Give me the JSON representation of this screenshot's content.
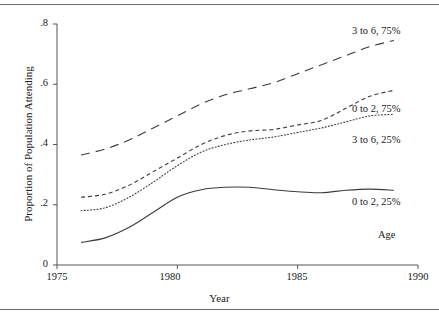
{
  "chart_data": {
    "type": "line",
    "title": "",
    "xlabel": "Year",
    "ylabel": "Proportion of Population Attending",
    "xlim": [
      1975,
      1990
    ],
    "ylim": [
      0,
      0.8
    ],
    "xticks": [
      1975,
      1980,
      1985,
      1990
    ],
    "xticklabels": [
      "1975",
      "1980",
      "1985",
      "1990"
    ],
    "yticks": [
      0,
      0.2,
      0.4,
      0.6,
      0.8
    ],
    "yticklabels": [
      "0",
      ".2",
      ".4",
      ".6",
      ".8"
    ],
    "grid": false,
    "legend_position": "inline-right",
    "legend_title": "Age",
    "series": [
      {
        "name": "3 to 6, 75%",
        "linestyle": "long-dash",
        "color": "#3c3c3c",
        "x": [
          1976,
          1977,
          1978,
          1979,
          1980,
          1981,
          1982,
          1983,
          1984,
          1985,
          1986,
          1987,
          1988,
          1989
        ],
        "values": [
          0.365,
          0.385,
          0.415,
          0.455,
          0.495,
          0.535,
          0.565,
          0.585,
          0.605,
          0.635,
          0.665,
          0.695,
          0.725,
          0.745
        ]
      },
      {
        "name": "0 to 2, 75%",
        "linestyle": "short-dash",
        "color": "#3c3c3c",
        "x": [
          1976,
          1977,
          1978,
          1979,
          1980,
          1981,
          1982,
          1983,
          1984,
          1985,
          1986,
          1987,
          1988,
          1989
        ],
        "values": [
          0.225,
          0.235,
          0.265,
          0.31,
          0.355,
          0.4,
          0.43,
          0.445,
          0.45,
          0.465,
          0.48,
          0.52,
          0.56,
          0.58
        ]
      },
      {
        "name": "3 to 6, 25%",
        "linestyle": "dotted",
        "color": "#3c3c3c",
        "x": [
          1976,
          1977,
          1978,
          1979,
          1980,
          1981,
          1982,
          1983,
          1984,
          1985,
          1986,
          1987,
          1988,
          1989
        ],
        "values": [
          0.18,
          0.19,
          0.225,
          0.275,
          0.33,
          0.375,
          0.4,
          0.415,
          0.425,
          0.44,
          0.455,
          0.475,
          0.495,
          0.5
        ]
      },
      {
        "name": "0 to 2, 25%",
        "linestyle": "solid",
        "color": "#3c3c3c",
        "x": [
          1976,
          1977,
          1978,
          1979,
          1980,
          1981,
          1982,
          1983,
          1984,
          1985,
          1986,
          1987,
          1988,
          1989
        ],
        "values": [
          0.075,
          0.09,
          0.125,
          0.175,
          0.225,
          0.25,
          0.258,
          0.258,
          0.25,
          0.243,
          0.24,
          0.248,
          0.252,
          0.248
        ]
      }
    ]
  },
  "axes": {
    "ylabel": "Proportion of Population Attending",
    "xlabel": "Year",
    "yticklabels": [
      "0",
      ".2",
      ".4",
      ".6",
      ".8"
    ],
    "xticklabels": [
      "1975",
      "1980",
      "1985",
      "1990"
    ]
  },
  "legend": {
    "title": "Age",
    "entries": [
      "3 to 6, 75%",
      "0 to 2, 75%",
      "3 to 6, 25%",
      "0 to 2, 25%"
    ]
  },
  "style": {
    "line_color": "#3c3c3c",
    "axis_color": "#555555",
    "rule_color": "#6e6e6e",
    "background": "#ffffff"
  }
}
